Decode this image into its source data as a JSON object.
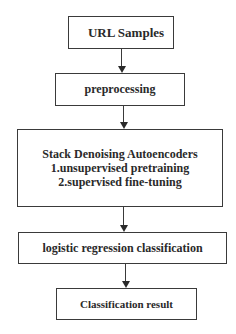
{
  "diagram": {
    "type": "flowchart",
    "nodes": [
      {
        "id": "url-samples",
        "label": "URL Samples"
      },
      {
        "id": "preprocessing",
        "label": "preprocessing"
      },
      {
        "id": "sda",
        "lines": [
          "Stack Denoising Autoencoders",
          "1.unsupervised pretraining",
          "2.supervised fine-tuning"
        ]
      },
      {
        "id": "logistic",
        "label": "logistic regression classification"
      },
      {
        "id": "result",
        "label": "Classification result"
      }
    ],
    "edges": [
      {
        "from": "url-samples",
        "to": "preprocessing"
      },
      {
        "from": "preprocessing",
        "to": "sda"
      },
      {
        "from": "sda",
        "to": "logistic"
      },
      {
        "from": "logistic",
        "to": "result"
      }
    ]
  }
}
